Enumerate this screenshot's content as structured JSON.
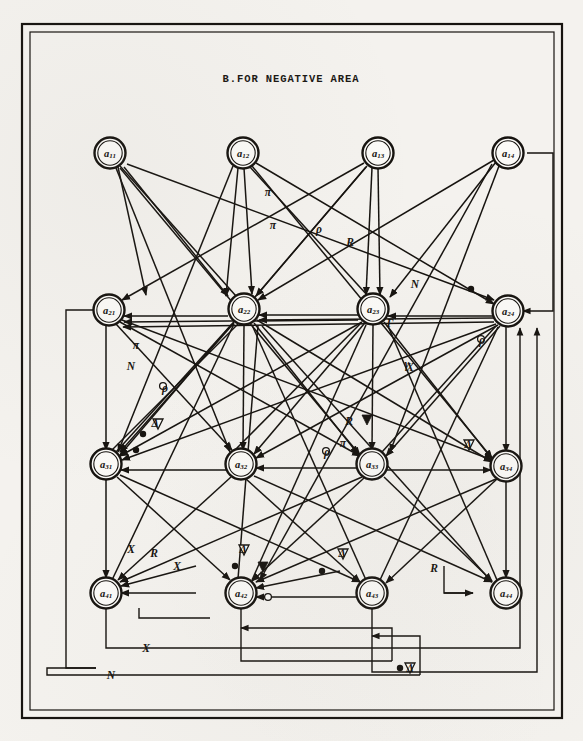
{
  "figure": {
    "title": "B.FOR NEGATIVE  AREA",
    "kind": "signal-flow-graph",
    "ink_color": "#16130f",
    "paper_color": "#f4f2ee"
  },
  "nodes": [
    {
      "id": "a11",
      "base": "a",
      "sub": "11",
      "x": 110,
      "y": 153
    },
    {
      "id": "a12",
      "base": "a",
      "sub": "12",
      "x": 243,
      "y": 153
    },
    {
      "id": "a13",
      "base": "a",
      "sub": "13",
      "x": 378,
      "y": 153
    },
    {
      "id": "a14",
      "base": "a",
      "sub": "14",
      "x": 508,
      "y": 153
    },
    {
      "id": "a21",
      "base": "a",
      "sub": "21",
      "x": 109,
      "y": 310
    },
    {
      "id": "a22",
      "base": "a",
      "sub": "22",
      "x": 244,
      "y": 309
    },
    {
      "id": "a23",
      "base": "a",
      "sub": "23",
      "x": 373,
      "y": 309
    },
    {
      "id": "a24",
      "base": "a",
      "sub": "24",
      "x": 508,
      "y": 311
    },
    {
      "id": "a31",
      "base": "a",
      "sub": "31",
      "x": 106,
      "y": 464
    },
    {
      "id": "a32",
      "base": "a",
      "sub": "32",
      "x": 241,
      "y": 464
    },
    {
      "id": "a33",
      "base": "a",
      "sub": "33",
      "x": 372,
      "y": 464
    },
    {
      "id": "a34",
      "base": "a",
      "sub": "34",
      "x": 506,
      "y": 466
    },
    {
      "id": "a41",
      "base": "a",
      "sub": "41",
      "x": 106,
      "y": 593
    },
    {
      "id": "a42",
      "base": "a",
      "sub": "42",
      "x": 241,
      "y": 593
    },
    {
      "id": "a43",
      "base": "a",
      "sub": "43",
      "x": 372,
      "y": 593
    },
    {
      "id": "a44",
      "base": "a",
      "sub": "44",
      "x": 506,
      "y": 593
    }
  ],
  "edge_labels": [
    {
      "text": "π",
      "x": 268,
      "y": 192
    },
    {
      "text": "π",
      "x": 273,
      "y": 225
    },
    {
      "text": "ρ",
      "x": 319,
      "y": 229
    },
    {
      "text": "R",
      "x": 350,
      "y": 242
    },
    {
      "text": "N",
      "x": 415,
      "y": 284
    },
    {
      "text": "π",
      "x": 136,
      "y": 345
    },
    {
      "text": "N",
      "x": 131,
      "y": 366
    },
    {
      "text": "ρ",
      "x": 165,
      "y": 388
    },
    {
      "text": "Γ",
      "x": 390,
      "y": 323
    },
    {
      "text": "ρ",
      "x": 482,
      "y": 340
    },
    {
      "text": "γ",
      "x": 407,
      "y": 364
    },
    {
      "text": "X",
      "x": 410,
      "y": 367
    },
    {
      "text": "Δ",
      "x": 155,
      "y": 423
    },
    {
      "text": "R",
      "x": 349,
      "y": 421
    },
    {
      "text": "π",
      "x": 343,
      "y": 443
    },
    {
      "text": "ρ",
      "x": 327,
      "y": 452
    },
    {
      "text": "Δ",
      "x": 468,
      "y": 444
    },
    {
      "text": "X",
      "x": 131,
      "y": 549
    },
    {
      "text": "R",
      "x": 154,
      "y": 553
    },
    {
      "text": "X",
      "x": 177,
      "y": 566
    },
    {
      "text": "Δ",
      "x": 243,
      "y": 549
    },
    {
      "text": "Δ",
      "x": 342,
      "y": 553
    },
    {
      "text": "R",
      "x": 434,
      "y": 568
    },
    {
      "text": "X",
      "x": 146,
      "y": 648
    },
    {
      "text": "N",
      "x": 111,
      "y": 675
    },
    {
      "text": "Δ",
      "x": 410,
      "y": 668
    }
  ],
  "frames": [
    {
      "name": "outer-border",
      "x": 22,
      "y": 24,
      "w": 540,
      "h": 694
    },
    {
      "name": "inner-border",
      "x": 30,
      "y": 32,
      "w": 524,
      "h": 678
    }
  ],
  "routes": [
    {
      "name": "a14-right-down-a24",
      "points": "527,153 553,153 553,311 523,311"
    },
    {
      "name": "a21-left-down",
      "points": "94,310 66,310 66,668 96,668"
    },
    {
      "name": "a41-bottom-x",
      "points": "106,608 106,648 520,648 520,332"
    },
    {
      "name": "bottom-n-bus",
      "points": "47,675 47,648"
    },
    {
      "name": "a42-up-bus",
      "points": "241,608 241,661 388,661"
    },
    {
      "name": "a43-up-bus",
      "points": "372,608 372,672 537,672 537,332"
    }
  ],
  "annotations": {
    "title_position": {
      "x": 291,
      "y": 79
    }
  }
}
